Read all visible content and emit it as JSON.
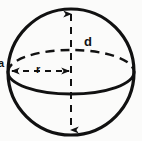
{
  "figure": {
    "name": "sphere-dimensions-diagram",
    "background_color": "#fbfbfa",
    "stroke_color": "#111111"
  },
  "labels": {
    "diameter": "d",
    "radius": "r",
    "edge": "a"
  },
  "geometry": {
    "outline": {
      "name": "sphere-outline-circle",
      "center_x": 71,
      "center_y": 72,
      "radius": 63,
      "stroke_width": 3.2
    },
    "equator": {
      "name": "equator-ellipse",
      "center_x": 71,
      "center_y": 72,
      "radius_x": 63,
      "radius_y": 22,
      "front_style": "solid",
      "back_style": "dashed",
      "stroke_width": 2.6
    },
    "diameter_line": {
      "name": "diameter-dimension-line",
      "x": 71,
      "y_top": 11,
      "y_bottom": 133,
      "style": "dashed",
      "arrowheads": "both",
      "stroke_width": 2.0
    },
    "radius_line": {
      "name": "radius-dimension-line",
      "y": 71,
      "x_left": 10,
      "x_right": 71,
      "style": "dashed",
      "arrowheads": "both",
      "stroke_width": 2.0
    }
  }
}
